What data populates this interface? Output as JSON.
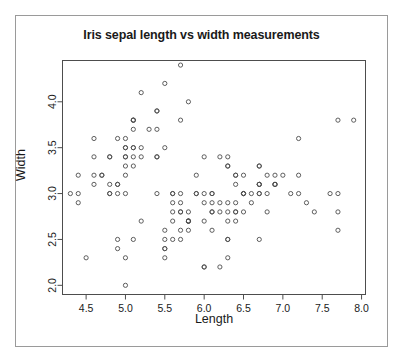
{
  "chart_data": {
    "type": "scatter",
    "title": "Iris sepal length vs width measurements",
    "xlabel": "Length",
    "ylabel": "Width",
    "xlim": [
      4.2,
      8.05
    ],
    "ylim": [
      1.9,
      4.45
    ],
    "xticks": [
      "4.5",
      "5.0",
      "5.5",
      "6.0",
      "6.5",
      "7.0",
      "7.5",
      "8.0"
    ],
    "xtick_values": [
      4.5,
      5.0,
      5.5,
      6.0,
      6.5,
      7.0,
      7.5,
      8.0
    ],
    "yticks": [
      "2.0",
      "2.5",
      "3.0",
      "3.5",
      "4.0"
    ],
    "ytick_values": [
      2.0,
      2.5,
      3.0,
      3.5,
      4.0
    ],
    "grid": false,
    "legend": null,
    "marker": "open-circle",
    "marker_color": "#4d4d4d",
    "point_count": 150,
    "x": [
      5.1,
      4.9,
      4.7,
      4.6,
      5.0,
      5.4,
      4.6,
      5.0,
      4.4,
      4.9,
      5.4,
      4.8,
      4.8,
      4.3,
      5.8,
      5.7,
      5.4,
      5.1,
      5.7,
      5.1,
      5.4,
      5.1,
      4.6,
      5.1,
      4.8,
      5.0,
      5.0,
      5.2,
      5.2,
      4.7,
      4.8,
      5.4,
      5.2,
      5.5,
      4.9,
      5.0,
      5.5,
      4.9,
      4.4,
      5.1,
      5.0,
      4.5,
      4.4,
      5.0,
      5.1,
      4.8,
      5.1,
      4.6,
      5.3,
      5.0,
      7.0,
      6.4,
      6.9,
      5.5,
      6.5,
      5.7,
      6.3,
      4.9,
      6.6,
      5.2,
      5.0,
      5.9,
      6.0,
      6.1,
      5.6,
      6.7,
      5.6,
      5.8,
      6.2,
      5.6,
      5.9,
      6.1,
      6.3,
      6.1,
      6.4,
      6.6,
      6.8,
      6.7,
      6.0,
      5.7,
      5.5,
      5.5,
      5.8,
      6.0,
      5.4,
      6.0,
      6.7,
      6.3,
      5.6,
      5.5,
      5.5,
      6.1,
      5.8,
      5.0,
      5.6,
      5.7,
      5.7,
      6.2,
      5.1,
      5.7,
      6.3,
      5.8,
      7.1,
      6.3,
      6.5,
      7.6,
      4.9,
      7.3,
      6.7,
      7.2,
      6.5,
      6.4,
      6.8,
      5.7,
      5.8,
      6.4,
      6.5,
      7.7,
      7.7,
      6.0,
      6.9,
      5.6,
      7.7,
      6.3,
      6.7,
      7.2,
      6.2,
      6.1,
      6.4,
      7.2,
      7.4,
      7.9,
      6.4,
      6.3,
      6.1,
      7.7,
      6.3,
      6.4,
      6.0,
      6.9,
      6.7,
      6.9,
      5.8,
      6.8,
      6.7,
      6.7,
      6.3,
      6.5,
      6.2,
      5.9
    ],
    "y": [
      3.5,
      3.0,
      3.2,
      3.1,
      3.6,
      3.9,
      3.4,
      3.4,
      2.9,
      3.1,
      3.7,
      3.4,
      3.0,
      3.0,
      4.0,
      4.4,
      3.9,
      3.5,
      3.8,
      3.8,
      3.4,
      3.7,
      3.6,
      3.3,
      3.4,
      3.0,
      3.4,
      3.5,
      3.4,
      3.2,
      3.1,
      3.4,
      4.1,
      4.2,
      3.1,
      3.2,
      3.5,
      3.6,
      3.0,
      3.4,
      3.5,
      2.3,
      3.2,
      3.5,
      3.8,
      3.0,
      3.8,
      3.2,
      3.7,
      3.3,
      3.2,
      3.2,
      3.1,
      2.3,
      2.8,
      2.8,
      3.3,
      2.4,
      2.9,
      2.7,
      2.0,
      3.0,
      2.2,
      2.9,
      2.9,
      3.1,
      3.0,
      2.7,
      2.2,
      2.5,
      3.2,
      2.8,
      2.5,
      2.8,
      2.9,
      3.0,
      2.8,
      3.0,
      2.9,
      2.6,
      2.4,
      2.4,
      2.7,
      2.7,
      3.0,
      3.4,
      3.1,
      2.3,
      3.0,
      2.5,
      2.6,
      3.0,
      2.6,
      2.3,
      2.7,
      3.0,
      2.9,
      2.9,
      2.5,
      2.8,
      3.3,
      2.7,
      3.0,
      2.9,
      3.0,
      3.0,
      2.5,
      2.9,
      2.5,
      3.6,
      3.2,
      2.7,
      3.0,
      2.5,
      2.8,
      3.2,
      3.0,
      3.8,
      2.6,
      2.2,
      3.2,
      2.8,
      2.8,
      2.7,
      3.3,
      3.2,
      2.8,
      3.0,
      2.8,
      3.0,
      2.8,
      3.8,
      2.8,
      2.8,
      2.6,
      3.0,
      3.4,
      3.1,
      3.0,
      3.1,
      3.1,
      3.1,
      2.7,
      3.2,
      3.3,
      3.0,
      2.5,
      3.0,
      3.4,
      3.0
    ]
  }
}
